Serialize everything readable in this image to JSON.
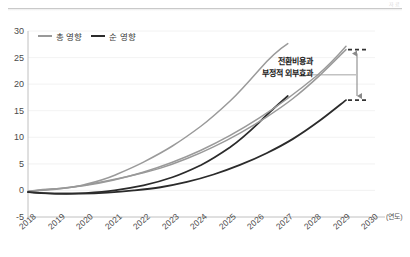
{
  "header": {
    "corner_note": "자료"
  },
  "legend": {
    "position": "top-left",
    "items": [
      {
        "label": "총 영향",
        "color": "#999999",
        "key": "total"
      },
      {
        "label": "순 영향",
        "color": "#2b2b2b",
        "key": "net"
      }
    ]
  },
  "annotation": {
    "line1": "전환비용과",
    "line2": "부정적 외부효과"
  },
  "axis": {
    "x_unit": "(연도)"
  },
  "chart_data": {
    "type": "line",
    "title": "",
    "subtitle": "",
    "xlabel": "(연도)",
    "ylabel": "",
    "grid": true,
    "legend_position": "top-left",
    "categories": [
      "2018",
      "2019",
      "2020",
      "2021",
      "2022",
      "2023",
      "2024",
      "2025",
      "2026",
      "2027",
      "2028",
      "2029",
      "2030"
    ],
    "x": [
      2018,
      2019,
      2020,
      2021,
      2022,
      2023,
      2024,
      2025,
      2026,
      2027,
      2028,
      2029,
      2030
    ],
    "xlim": [
      2018,
      2030
    ],
    "ylim": [
      -5,
      30
    ],
    "yticks": [
      -5,
      0,
      5,
      10,
      15,
      20,
      25,
      30
    ],
    "series": [
      {
        "name": "총 영향",
        "color": "#999999",
        "values": [
          -0.2,
          0.3,
          0.9,
          1.8,
          2.9,
          4.2,
          6.0,
          8.2,
          10.8,
          13.8,
          17.3,
          21.6,
          26.5
        ]
      },
      {
        "name": "순 영향",
        "color": "#2b2b2b",
        "values": [
          -0.3,
          -0.6,
          -0.6,
          -0.4,
          0.0,
          0.6,
          1.6,
          3.0,
          4.8,
          7.0,
          9.7,
          13.1,
          17.0
        ]
      }
    ],
    "annotations": [
      {
        "text": "전환비용과 부정적 외부효과",
        "type": "range-arrow",
        "at_x": 2030,
        "y_from": 17.0,
        "y_to": 26.5
      }
    ]
  }
}
